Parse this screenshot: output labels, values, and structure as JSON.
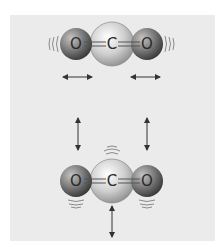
{
  "diagram": {
    "molecules": [
      {
        "mode": "stretching",
        "atoms": [
          {
            "label": "O",
            "cx": 76,
            "cy": 44,
            "r": 16
          },
          {
            "label": "C",
            "cx": 112,
            "cy": 44,
            "r": 22
          },
          {
            "label": "O",
            "cx": 147,
            "cy": 44,
            "r": 16
          }
        ],
        "bonds": [
          "O=C",
          "C=O"
        ],
        "motion_arrows": [
          {
            "direction": "horizontal",
            "x1": 62,
            "x2": 92,
            "y": 77
          },
          {
            "direction": "horizontal",
            "x1": 130,
            "x2": 160,
            "y": 77
          }
        ],
        "vibration_lines": [
          "left-of-left-O",
          "right-of-right-O"
        ]
      },
      {
        "mode": "bending",
        "atoms": [
          {
            "label": "O",
            "cx": 76,
            "cy": 181,
            "r": 16
          },
          {
            "label": "C",
            "cx": 112,
            "cy": 181,
            "r": 22
          },
          {
            "label": "O",
            "cx": 147,
            "cy": 181,
            "r": 16
          }
        ],
        "bonds": [
          "O=C",
          "C=O"
        ],
        "motion_arrows": [
          {
            "direction": "vertical",
            "x": 78,
            "y1": 117,
            "y2": 150
          },
          {
            "direction": "vertical",
            "x": 147,
            "y1": 117,
            "y2": 150
          },
          {
            "direction": "vertical",
            "x": 112,
            "y1": 205,
            "y2": 237
          }
        ],
        "vibration_lines": [
          "above-C",
          "below-left-O",
          "below-right-O"
        ]
      }
    ],
    "colors": {
      "background": "#ffffff",
      "panel": "#ebebeb",
      "oxygen_dark": "#4a4a4a",
      "oxygen_light": "#b8b8b8",
      "carbon_dark": "#8a8a8a",
      "carbon_light": "#f2f2f2",
      "arrow": "#333333",
      "vibration": "#8a8a8a"
    }
  },
  "labels": {
    "top_o_left": "O",
    "top_c": "C",
    "top_o_right": "O",
    "bottom_o_left": "O",
    "bottom_c": "C",
    "bottom_o_right": "O"
  }
}
